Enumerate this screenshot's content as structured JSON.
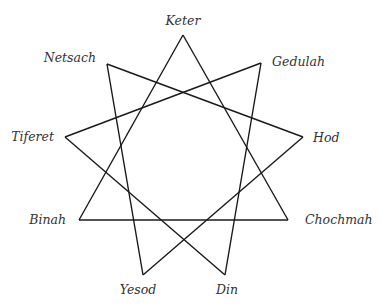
{
  "diagram": {
    "type": "enneagram",
    "nodes": [
      {
        "id": "keter",
        "label": "Keter",
        "x": 183,
        "y": 35,
        "label_x": 183,
        "label_y": 25,
        "anchor": "middle"
      },
      {
        "id": "gedulah",
        "label": "Gedulah",
        "x": 261,
        "y": 63,
        "label_x": 272,
        "label_y": 66,
        "anchor": "start"
      },
      {
        "id": "hod",
        "label": "Hod",
        "x": 303,
        "y": 137,
        "label_x": 313,
        "label_y": 142,
        "anchor": "start"
      },
      {
        "id": "chochmah",
        "label": "Chochmah",
        "x": 288,
        "y": 220,
        "label_x": 305,
        "label_y": 224,
        "anchor": "start"
      },
      {
        "id": "din",
        "label": "Din",
        "x": 225,
        "y": 275,
        "label_x": 227,
        "label_y": 294,
        "anchor": "middle"
      },
      {
        "id": "yesod",
        "label": "Yesod",
        "x": 143,
        "y": 275,
        "label_x": 138,
        "label_y": 294,
        "anchor": "middle"
      },
      {
        "id": "binah",
        "label": "Binah",
        "x": 79,
        "y": 220,
        "label_x": 66,
        "label_y": 224,
        "anchor": "end"
      },
      {
        "id": "tiferet",
        "label": "Tiferet",
        "x": 65,
        "y": 137,
        "label_x": 54,
        "label_y": 141,
        "anchor": "end"
      },
      {
        "id": "netsach",
        "label": "Netsach",
        "x": 107,
        "y": 64,
        "label_x": 96,
        "label_y": 62,
        "anchor": "end"
      }
    ],
    "edges": [
      {
        "from": "keter",
        "to": "binah"
      },
      {
        "from": "binah",
        "to": "chochmah"
      },
      {
        "from": "chochmah",
        "to": "keter"
      },
      {
        "from": "netsach",
        "to": "hod"
      },
      {
        "from": "hod",
        "to": "yesod"
      },
      {
        "from": "yesod",
        "to": "netsach"
      },
      {
        "from": "gedulah",
        "to": "tiferet"
      },
      {
        "from": "tiferet",
        "to": "din"
      },
      {
        "from": "din",
        "to": "gedulah"
      }
    ],
    "colors": {
      "line": "#1a1a1a",
      "label": "#333333",
      "background": "#ffffff"
    }
  }
}
